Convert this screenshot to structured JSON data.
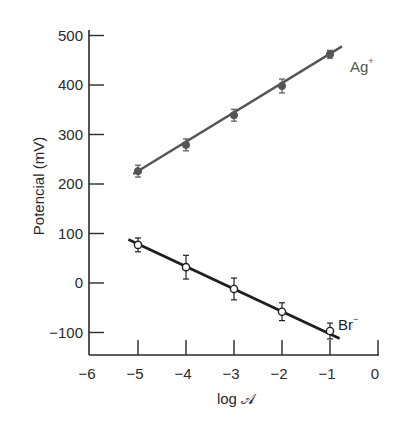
{
  "chart_data": {
    "type": "scatter",
    "title": "",
    "xlabel": "log 𝒜",
    "ylabel": "Potencial (mV)",
    "xlim": [
      -6,
      0
    ],
    "ylim": [
      -150,
      510
    ],
    "grid": false,
    "legend": "inline labels at line ends",
    "x_ticks": [
      -6,
      -5,
      -4,
      -3,
      -2,
      -1,
      0
    ],
    "x_tick_labels": [
      "−6",
      "−5",
      "−4",
      "−3",
      "−2",
      "−1",
      "0"
    ],
    "y_ticks": [
      500,
      400,
      300,
      200,
      100,
      0,
      -100
    ],
    "y_tick_labels": [
      "500",
      "400",
      "300",
      "200",
      "100",
      "0",
      "−100"
    ],
    "series": [
      {
        "name": "Ag+",
        "label": "Ag",
        "label_sup": "+",
        "color": "#555555",
        "marker": "filled-circle",
        "x": [
          -5,
          -4,
          -3,
          -2,
          -1
        ],
        "y": [
          226,
          279,
          339,
          398,
          462
        ],
        "error": [
          12,
          12,
          12,
          14,
          8
        ],
        "fit_line": {
          "x": [
            -5.1,
            -0.75
          ],
          "y": [
            220,
            478
          ]
        }
      },
      {
        "name": "Br-",
        "label": "Br",
        "label_sup": "−",
        "color": "#1e1e1e",
        "marker": "open-circle",
        "x": [
          -5,
          -4,
          -3,
          -2,
          -1
        ],
        "y": [
          77,
          32,
          -12,
          -58,
          -97
        ],
        "error": [
          14,
          24,
          22,
          18,
          16
        ],
        "fit_line": {
          "x": [
            -5.2,
            -0.8
          ],
          "y": [
            88,
            -112
          ]
        }
      }
    ]
  }
}
